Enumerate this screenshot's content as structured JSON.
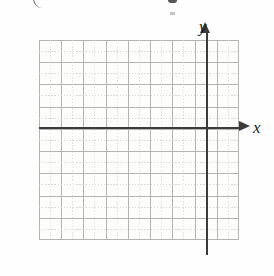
{
  "figure": {
    "type": "blank-coordinate-grid",
    "width": 274,
    "height": 276
  },
  "axes": {
    "x_label": "x",
    "y_label": "y"
  },
  "chart_data": {
    "type": "scatter",
    "title": "",
    "subtitle": "",
    "xlabel": "x",
    "ylabel": "y",
    "series": [
      {
        "name": "",
        "x": [],
        "y": []
      }
    ],
    "annotations": [],
    "legend": {
      "entries": [],
      "position": "none"
    },
    "grid": {
      "visible": true,
      "columns": 9,
      "rows": 9,
      "major_spacing_px": 22.2,
      "minor_dotted_midlines": true,
      "major_color": "#b4b4b4",
      "minor_color": "#d8d8d8"
    },
    "axis_style": {
      "x_axis_row_from_top": 4,
      "y_axis_column_from_left": 8,
      "arrowheads": true,
      "color": "#3b3b3b",
      "tick_labels": []
    },
    "xlim": [
      -8,
      1
    ],
    "ylim": [
      -5,
      4
    ],
    "xticks": [],
    "yticks": [],
    "background_color": "#fdfdfc"
  },
  "artifacts": {
    "top_partial_glyph_left": "(",
    "top_partial_glyph_right": "g"
  }
}
